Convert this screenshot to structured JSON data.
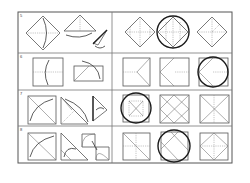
{
  "worksheet": {
    "rows": [
      {
        "label": "5",
        "steps": [
          "diamond-fold-down",
          "triangle-fold",
          "slim-cone"
        ],
        "options": [
          "option-a",
          "option-b",
          "option-c"
        ],
        "selected_option": 2
      },
      {
        "label": "6",
        "steps": [
          "square-fold-center",
          "rectangle-fold-corner"
        ],
        "options": [
          "option-a",
          "option-b",
          "option-c"
        ],
        "selected_option": 3
      },
      {
        "label": "7",
        "steps": [
          "square-diagonal-fold",
          "triangle-fold-corner",
          "small-kite"
        ],
        "options": [
          "option-a",
          "option-b",
          "option-c"
        ],
        "selected_option": 1
      },
      {
        "label": "8",
        "steps": [
          "square-diagonal-fold",
          "triangle-fold-tip",
          "double-fold"
        ],
        "options": [
          "option-a",
          "option-b",
          "option-c"
        ],
        "selected_option": 2
      }
    ],
    "colors": {
      "line": "#555555",
      "selection_circle": "#1a1a1a",
      "background": "#ffffff"
    }
  }
}
